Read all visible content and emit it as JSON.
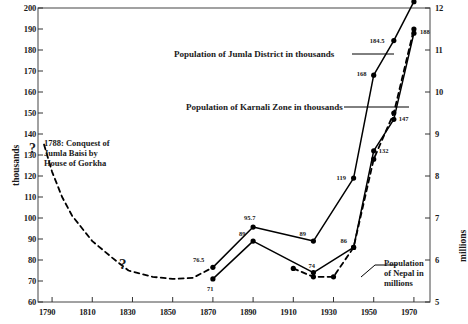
{
  "chart_data": {
    "type": "line",
    "title": "",
    "xlabel": "",
    "ylabel": "thousands",
    "ylabel_right": "millions",
    "xlim": [
      1783,
      1978
    ],
    "ylim": [
      60,
      200
    ],
    "ylim_right": [
      5,
      12
    ],
    "grid": false,
    "legend": "annotations",
    "xticks": [
      1790,
      1810,
      1830,
      1850,
      1870,
      1890,
      1910,
      1930,
      1950,
      1970
    ],
    "yticks": [
      60,
      70,
      80,
      90,
      100,
      110,
      120,
      130,
      140,
      150,
      160,
      170,
      180,
      190,
      200
    ],
    "yticks_right": [
      5,
      6,
      7,
      8,
      9,
      10,
      11,
      12
    ],
    "series": [
      {
        "name": "Population of Jumla District in thousands",
        "axis": "left",
        "style": "solid",
        "x": [
          1870,
          1890,
          1920,
          1940,
          1950,
          1960,
          1970
        ],
        "values": [
          71,
          89,
          74,
          86,
          132,
          147,
          188
        ],
        "point_labels": [
          "71",
          "89",
          "74",
          "86",
          "132",
          "147",
          "188"
        ]
      },
      {
        "name": "Population of Karnali Zone in thousands",
        "axis": "left",
        "style": "solid",
        "x": [
          1870,
          1890,
          1920,
          1940,
          1950,
          1960,
          1970
        ],
        "values": [
          76.5,
          95.7,
          89,
          119,
          168,
          184.5,
          203
        ],
        "point_labels": [
          "76.5",
          "95.7",
          "89",
          "119",
          "168",
          "184.5",
          "203"
        ]
      },
      {
        "name": "Population of Nepal in millions",
        "axis": "right",
        "style": "dashed",
        "x": [
          1910,
          1920,
          1930,
          1940,
          1950,
          1960,
          1970
        ],
        "values": [
          5.8,
          5.6,
          5.6,
          6.3,
          8.4,
          9.5,
          11.5
        ],
        "point_labels": [
          "",
          "",
          "",
          "",
          "",
          "",
          ""
        ]
      },
      {
        "name": "Jumla historical estimate",
        "axis": "left",
        "style": "dashed",
        "x": [
          1786,
          1790,
          1795,
          1800,
          1810,
          1820,
          1828,
          1840,
          1850,
          1860,
          1870
        ],
        "values": [
          135,
          122,
          110,
          101,
          89,
          81,
          75,
          72,
          71,
          71.5,
          76.5
        ],
        "point_labels": [
          "",
          "",
          "",
          "",
          "",
          "",
          "",
          "",
          "",
          "",
          ""
        ]
      }
    ],
    "annotations": [
      {
        "name": "conquest-note",
        "text_lines": [
          "1788: Conquest of",
          "Jumla Baisi by",
          "House of Gorkha"
        ],
        "marker": "?"
      },
      {
        "name": "uncertainty-marker",
        "text": "?"
      },
      {
        "name": "jumla-district-callout",
        "text": "Population of Jumla District in thousands"
      },
      {
        "name": "karnali-zone-callout",
        "text": "Population of Karnali Zone in thousands"
      },
      {
        "name": "nepal-callout",
        "text_lines": [
          "Population",
          "of Nepal in",
          "millions"
        ]
      }
    ]
  },
  "axes": {
    "left_title": "thousands",
    "right_title": "millions"
  },
  "colors": {
    "line": "#000000",
    "background": "#ffffff",
    "text": "#1a1a1a"
  }
}
